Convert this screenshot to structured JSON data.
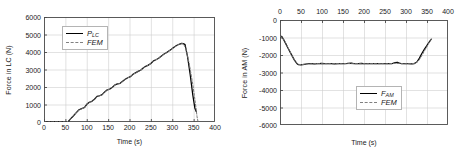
{
  "figure": {
    "panels": [
      {
        "id": "load-cell-force",
        "axis_position": "bottom",
        "y_title": "Force in LC (N)",
        "x_title": "Time (s)",
        "legend": [
          {
            "label_main": "P",
            "label_sub": "LC",
            "style": "solid"
          },
          {
            "label_main": "FEM",
            "label_sub": "",
            "style": "dashed"
          }
        ]
      },
      {
        "id": "anchor-member-force",
        "axis_position": "top",
        "y_title": "Force in AM (N)",
        "x_title": "Time (s)",
        "legend": [
          {
            "label_main": "F",
            "label_sub": "AM",
            "style": "solid"
          },
          {
            "label_main": "FEM",
            "label_sub": "",
            "style": "dashed"
          }
        ]
      }
    ]
  },
  "chart_data": [
    {
      "type": "line",
      "id": "load-cell-force",
      "title": "",
      "xlabel": "Time (s)",
      "ylabel": "Force in LC (N)",
      "xlim": [
        0,
        400
      ],
      "ylim": [
        0,
        6000
      ],
      "xticks": [
        0,
        50,
        100,
        150,
        200,
        250,
        300,
        350,
        400
      ],
      "yticks": [
        0,
        1000,
        2000,
        3000,
        4000,
        5000,
        6000
      ],
      "x_axis_position": "bottom",
      "grid": true,
      "legend_position": "upper left",
      "series": [
        {
          "name": "P_LC",
          "style": "solid",
          "color": "#000000",
          "x": [
            0,
            10,
            20,
            30,
            40,
            50,
            57,
            62,
            68,
            75,
            82,
            88,
            95,
            100,
            106,
            112,
            118,
            124,
            130,
            136,
            142,
            148,
            154,
            160,
            166,
            172,
            178,
            184,
            190,
            196,
            202,
            208,
            214,
            220,
            226,
            232,
            238,
            244,
            250,
            256,
            262,
            268,
            274,
            280,
            286,
            292,
            298,
            304,
            310,
            316,
            322,
            326,
            330,
            336,
            342,
            348,
            353,
            356
          ],
          "y": [
            10,
            10,
            10,
            10,
            10,
            15,
            40,
            180,
            330,
            520,
            700,
            760,
            830,
            1010,
            1130,
            1180,
            1300,
            1460,
            1500,
            1560,
            1720,
            1840,
            1880,
            1990,
            2120,
            2180,
            2210,
            2330,
            2440,
            2530,
            2590,
            2720,
            2810,
            2890,
            2960,
            3080,
            3180,
            3250,
            3340,
            3490,
            3560,
            3640,
            3760,
            3870,
            3960,
            4060,
            4160,
            4270,
            4370,
            4440,
            4490,
            4480,
            4420,
            3700,
            2700,
            1550,
            780,
            600
          ]
        },
        {
          "name": "FEM",
          "style": "dashed",
          "color": "#777777",
          "x": [
            0,
            10,
            20,
            30,
            40,
            50,
            57,
            62,
            68,
            75,
            82,
            88,
            95,
            100,
            106,
            112,
            118,
            124,
            130,
            136,
            142,
            148,
            154,
            160,
            166,
            172,
            178,
            184,
            190,
            196,
            202,
            208,
            214,
            220,
            226,
            232,
            238,
            244,
            250,
            256,
            262,
            268,
            274,
            280,
            286,
            292,
            298,
            304,
            310,
            316,
            322,
            326,
            332,
            340,
            348,
            354,
            358,
            360
          ],
          "y": [
            5,
            5,
            5,
            5,
            5,
            10,
            35,
            175,
            325,
            515,
            695,
            755,
            825,
            1005,
            1125,
            1175,
            1295,
            1455,
            1495,
            1555,
            1715,
            1835,
            1875,
            1985,
            2115,
            2175,
            2205,
            2325,
            2435,
            2525,
            2585,
            2715,
            2805,
            2885,
            2955,
            3075,
            3175,
            3245,
            3335,
            3485,
            3555,
            3635,
            3755,
            3865,
            3955,
            4055,
            4155,
            4265,
            4365,
            4435,
            4485,
            4470,
            4200,
            3300,
            2150,
            1100,
            300,
            60
          ]
        }
      ]
    },
    {
      "type": "line",
      "id": "anchor-member-force",
      "title": "",
      "xlabel": "Time (s)",
      "ylabel": "Force in AM (N)",
      "xlim": [
        0,
        400
      ],
      "ylim": [
        -6000,
        0
      ],
      "xticks": [
        0,
        50,
        100,
        150,
        200,
        250,
        300,
        350,
        400
      ],
      "yticks": [
        0,
        -1000,
        -2000,
        -3000,
        -4000,
        -5000,
        -6000
      ],
      "x_axis_position": "top",
      "grid": true,
      "legend_position": "lower right",
      "series": [
        {
          "name": "F_AM",
          "style": "solid",
          "color": "#000000",
          "x": [
            0,
            4,
            10,
            18,
            26,
            34,
            40,
            44,
            50,
            58,
            66,
            74,
            82,
            90,
            98,
            106,
            114,
            122,
            130,
            138,
            146,
            154,
            162,
            170,
            178,
            186,
            194,
            202,
            210,
            218,
            226,
            234,
            242,
            250,
            258,
            266,
            274,
            280,
            284,
            290,
            298,
            306,
            314,
            320,
            326,
            332,
            338,
            344,
            350,
            356,
            360
          ],
          "y": [
            -950,
            -930,
            -1180,
            -1560,
            -1920,
            -2280,
            -2480,
            -2550,
            -2560,
            -2530,
            -2500,
            -2490,
            -2505,
            -2500,
            -2480,
            -2495,
            -2500,
            -2490,
            -2505,
            -2500,
            -2490,
            -2500,
            -2480,
            -2470,
            -2500,
            -2495,
            -2480,
            -2500,
            -2490,
            -2500,
            -2495,
            -2490,
            -2500,
            -2495,
            -2490,
            -2500,
            -2440,
            -2420,
            -2470,
            -2500,
            -2490,
            -2500,
            -2510,
            -2490,
            -2400,
            -2180,
            -1900,
            -1660,
            -1450,
            -1230,
            -1100
          ]
        },
        {
          "name": "FEM",
          "style": "dashed",
          "color": "#777777",
          "x": [
            0,
            6,
            14,
            22,
            30,
            38,
            44,
            52,
            64,
            78,
            92,
            106,
            120,
            134,
            148,
            162,
            176,
            190,
            204,
            218,
            232,
            246,
            260,
            274,
            288,
            300,
            312,
            322,
            330,
            338,
            346,
            352,
            358,
            360
          ],
          "y": [
            -940,
            -1000,
            -1330,
            -1720,
            -2110,
            -2420,
            -2540,
            -2545,
            -2520,
            -2500,
            -2495,
            -2500,
            -2495,
            -2500,
            -2495,
            -2490,
            -2500,
            -2495,
            -2500,
            -2495,
            -2500,
            -2495,
            -2500,
            -2470,
            -2490,
            -2500,
            -2505,
            -2470,
            -2330,
            -2020,
            -1680,
            -1430,
            -1150,
            -1090
          ]
        }
      ]
    }
  ]
}
